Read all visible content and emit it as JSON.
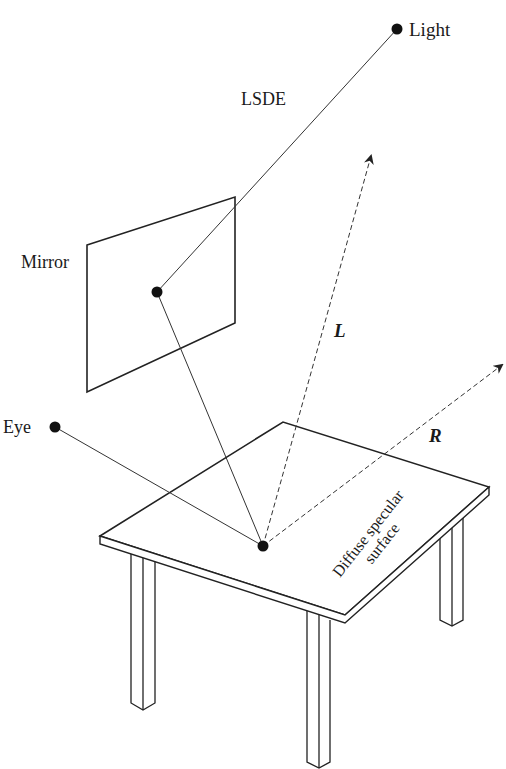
{
  "diagram": {
    "top_cut_text": "…g  …p…",
    "labels": {
      "light": "Light",
      "path": "LSDE",
      "mirror": "Mirror",
      "eye": "Eye",
      "L": "L",
      "R": "R",
      "surface_line1": "Diffuse specular",
      "surface_line2": "surface"
    },
    "points": {
      "light": [
        397,
        29
      ],
      "mirror_hit": [
        157,
        292
      ],
      "eye": [
        55,
        427
      ],
      "surface_hit": [
        263,
        546
      ],
      "L_tip": [
        371,
        156
      ],
      "R_tip": [
        502,
        365
      ]
    },
    "colors": {
      "ink": "#222222",
      "background": "#ffffff"
    }
  }
}
